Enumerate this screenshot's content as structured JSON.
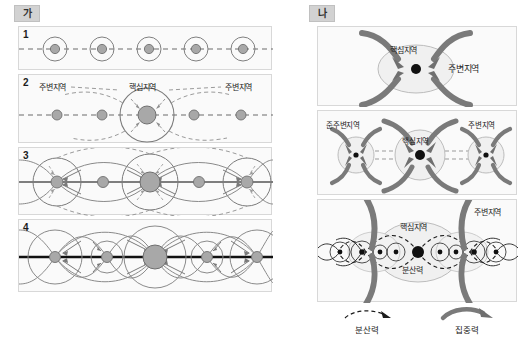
{
  "figure": {
    "groups": [
      {
        "tag": "가",
        "name": "left-group"
      },
      {
        "tag": "나",
        "name": "right-group"
      }
    ],
    "left_panels": [
      {
        "number": "1",
        "caption": ""
      },
      {
        "number": "2",
        "caption": ""
      },
      {
        "number": "3",
        "caption": ""
      },
      {
        "number": "4",
        "caption": ""
      }
    ],
    "labels": {
      "core": "핵심지역",
      "periphery": "주변지역",
      "semi_periphery": "준주변지역",
      "dispersal_force": "분산력",
      "concentration_force": "집중력"
    },
    "panel2": {
      "left_periphery": "주변지역",
      "core": "핵심지역",
      "right_periphery": "주변지역"
    },
    "panelA": {
      "core": "핵심지역",
      "periphery": "주변지역"
    },
    "panelB": {
      "semi_periphery": "준주변지역",
      "core": "핵심지역",
      "periphery": "주변지역"
    },
    "panelC": {
      "core": "핵심지역",
      "dispersal": "분산력",
      "periphery": "주변지역"
    },
    "legend": [
      {
        "symbol": "dashed-arrow",
        "label": "분산력"
      },
      {
        "symbol": "solid-thick-arrow",
        "label": "집중력"
      }
    ],
    "colors": {
      "node_fill": "#a8a8a8",
      "node_stroke": "#6f6f6f",
      "ring_stroke": "#808080",
      "dashed_stroke": "#8c8c8c",
      "thick_arrow": "#7a7a7a",
      "core_dot": "#111111",
      "panel_bg": "#fafafa",
      "panel_border": "#d8d8d8",
      "tag_bg": "#d2d2d2"
    }
  }
}
